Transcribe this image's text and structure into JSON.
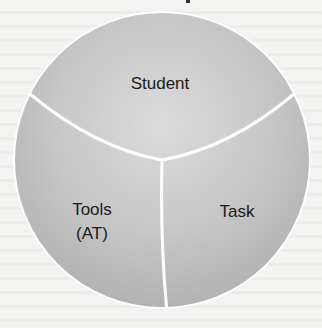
{
  "diagram": {
    "type": "three-part circle",
    "segments": [
      {
        "id": "student",
        "label": "Student"
      },
      {
        "id": "tools",
        "label_line1": "Tools",
        "label_line2": "(AT)"
      },
      {
        "id": "task",
        "label": "Task"
      }
    ]
  },
  "colors": {
    "circle_fill_light": "#dadada",
    "circle_fill_dark": "#b3b3b3",
    "divider": "#ffffff",
    "text": "#1a1a1a"
  }
}
